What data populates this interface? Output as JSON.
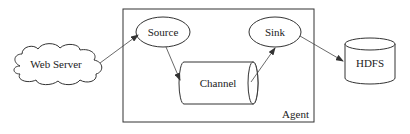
{
  "diagram": {
    "type": "flume-architecture",
    "nodes": {
      "web_server": {
        "label": "Web Server",
        "shape": "cloud"
      },
      "source": {
        "label": "Source",
        "shape": "ellipse"
      },
      "channel": {
        "label": "Channel",
        "shape": "horizontal-cylinder"
      },
      "sink": {
        "label": "Sink",
        "shape": "ellipse"
      },
      "hdfs": {
        "label": "HDFS",
        "shape": "vertical-cylinder"
      },
      "agent": {
        "label": "Agent",
        "shape": "rectangle-container"
      }
    },
    "edges": [
      {
        "from": "Web Server",
        "to": "Source"
      },
      {
        "from": "Source",
        "to": "Channel"
      },
      {
        "from": "Channel",
        "to": "Sink"
      },
      {
        "from": "Sink",
        "to": "HDFS"
      }
    ],
    "colors": {
      "stroke": "#333333",
      "background": "#ffffff",
      "text": "#222222"
    }
  }
}
